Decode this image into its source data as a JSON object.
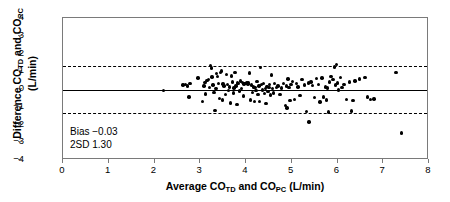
{
  "chart_data": {
    "type": "scatter",
    "title": "",
    "xlabel": "Average CO_TD and CO_PC (L/min)",
    "ylabel": "Difference CO_TD and CO_PC (L/min)",
    "xlim": [
      0,
      8
    ],
    "ylim": [
      -4,
      4
    ],
    "xticks": [
      0,
      1,
      2,
      3,
      4,
      5,
      6,
      7,
      8
    ],
    "yticks": [
      -4,
      -3,
      -2,
      -1,
      0,
      1,
      2,
      3,
      4
    ],
    "grid": false,
    "legend": null,
    "bias": -0.03,
    "two_sd": 1.3,
    "reference_lines": [
      {
        "name": "bias",
        "y": -0.03,
        "style": "solid"
      },
      {
        "name": "upper-limit-of-agreement",
        "y": 1.27,
        "style": "dashed"
      },
      {
        "name": "lower-limit-of-agreement",
        "y": -1.33,
        "style": "dashed"
      }
    ],
    "points": [
      [
        2.2,
        -0.1
      ],
      [
        2.62,
        0.22
      ],
      [
        2.68,
        0.24
      ],
      [
        2.72,
        0.18
      ],
      [
        2.75,
        -0.45
      ],
      [
        2.78,
        0.3
      ],
      [
        2.95,
        0.62
      ],
      [
        3.05,
        -0.72
      ],
      [
        3.08,
        0.18
      ],
      [
        3.1,
        0.35
      ],
      [
        3.12,
        -0.28
      ],
      [
        3.15,
        0.48
      ],
      [
        3.18,
        0.52
      ],
      [
        3.2,
        0.1
      ],
      [
        3.22,
        1.32
      ],
      [
        3.24,
        1.18
      ],
      [
        3.26,
        0.68
      ],
      [
        3.28,
        0.22
      ],
      [
        3.3,
        -0.18
      ],
      [
        3.32,
        -1.22
      ],
      [
        3.34,
        0.02
      ],
      [
        3.36,
        0.88
      ],
      [
        3.38,
        0.72
      ],
      [
        3.4,
        0.3
      ],
      [
        3.42,
        -0.52
      ],
      [
        3.44,
        0.92
      ],
      [
        3.46,
        1.02
      ],
      [
        3.48,
        -0.62
      ],
      [
        3.5,
        0.28
      ],
      [
        3.52,
        0.18
      ],
      [
        3.55,
        -0.3
      ],
      [
        3.58,
        0.82
      ],
      [
        3.6,
        0.26
      ],
      [
        3.62,
        -0.08
      ],
      [
        3.64,
        0.12
      ],
      [
        3.66,
        -0.78
      ],
      [
        3.68,
        0.74
      ],
      [
        3.7,
        0.4
      ],
      [
        3.72,
        -0.22
      ],
      [
        3.74,
        0.06
      ],
      [
        3.76,
        0.92
      ],
      [
        3.78,
        0.18
      ],
      [
        3.8,
        -0.88
      ],
      [
        3.82,
        0.34
      ],
      [
        3.84,
        0.3
      ],
      [
        3.86,
        -0.12
      ],
      [
        3.88,
        0.46
      ],
      [
        3.9,
        0.02
      ],
      [
        3.92,
        0.36
      ],
      [
        3.94,
        -0.4
      ],
      [
        3.96,
        0.28
      ],
      [
        3.98,
        0.32
      ],
      [
        4.0,
        0.3
      ],
      [
        4.02,
        0.34
      ],
      [
        4.04,
        0.28
      ],
      [
        4.06,
        0.36
      ],
      [
        4.08,
        0.9
      ],
      [
        4.1,
        -0.62
      ],
      [
        4.12,
        0.22
      ],
      [
        4.14,
        -0.18
      ],
      [
        4.16,
        0.12
      ],
      [
        4.18,
        -0.7
      ],
      [
        4.2,
        0.08
      ],
      [
        4.22,
        -0.1
      ],
      [
        4.24,
        0.44
      ],
      [
        4.26,
        -0.32
      ],
      [
        4.28,
        0.18
      ],
      [
        4.3,
        -0.72
      ],
      [
        4.32,
        1.22
      ],
      [
        4.34,
        0.26
      ],
      [
        4.36,
        -0.06
      ],
      [
        4.38,
        0.3
      ],
      [
        4.4,
        -0.26
      ],
      [
        4.42,
        0.02
      ],
      [
        4.44,
        -0.82
      ],
      [
        4.46,
        0.14
      ],
      [
        4.48,
        -0.14
      ],
      [
        4.5,
        0.1
      ],
      [
        4.52,
        0.26
      ],
      [
        4.54,
        -0.34
      ],
      [
        4.56,
        0.8
      ],
      [
        4.58,
        0.04
      ],
      [
        4.6,
        -0.22
      ],
      [
        4.62,
        0.3
      ],
      [
        4.66,
        0.08
      ],
      [
        4.7,
        0.16
      ],
      [
        4.74,
        -0.3
      ],
      [
        4.78,
        0.06
      ],
      [
        4.82,
        0.32
      ],
      [
        4.86,
        -0.92
      ],
      [
        4.88,
        0.18
      ],
      [
        4.9,
        -1.08
      ],
      [
        4.92,
        0.56
      ],
      [
        4.94,
        0.08
      ],
      [
        4.96,
        -0.66
      ],
      [
        4.98,
        0.26
      ],
      [
        5.02,
        0.44
      ],
      [
        5.06,
        -0.58
      ],
      [
        5.1,
        0.3
      ],
      [
        5.14,
        0.12
      ],
      [
        5.18,
        -0.36
      ],
      [
        5.22,
        0.52
      ],
      [
        5.28,
        0.22
      ],
      [
        5.32,
        -1.28
      ],
      [
        5.36,
        0.34
      ],
      [
        5.38,
        -1.86
      ],
      [
        5.42,
        0.4
      ],
      [
        5.46,
        0.2
      ],
      [
        5.5,
        -0.48
      ],
      [
        5.54,
        0.58
      ],
      [
        5.58,
        0.26
      ],
      [
        5.62,
        -0.74
      ],
      [
        5.66,
        0.62
      ],
      [
        5.7,
        -0.44
      ],
      [
        5.74,
        0.12
      ],
      [
        5.76,
        -0.62
      ],
      [
        5.78,
        0.06
      ],
      [
        5.8,
        -1.3
      ],
      [
        5.82,
        0.4
      ],
      [
        5.86,
        0.7
      ],
      [
        5.9,
        0.54
      ],
      [
        5.94,
        1.24
      ],
      [
        5.96,
        0.22
      ],
      [
        5.98,
        1.38
      ],
      [
        6.0,
        0.34
      ],
      [
        6.02,
        -0.06
      ],
      [
        6.06,
        0.64
      ],
      [
        6.1,
        0.08
      ],
      [
        6.14,
        0.26
      ],
      [
        6.2,
        -0.58
      ],
      [
        6.26,
        0.4
      ],
      [
        6.3,
        -1.24
      ],
      [
        6.34,
        -0.64
      ],
      [
        6.38,
        0.46
      ],
      [
        6.48,
        0.56
      ],
      [
        6.6,
        0.66
      ],
      [
        6.66,
        -0.46
      ],
      [
        6.72,
        -0.58
      ],
      [
        6.8,
        -0.56
      ],
      [
        7.28,
        0.92
      ],
      [
        7.4,
        -2.48
      ]
    ]
  },
  "annotations": {
    "bias_text": "Bias −0.03",
    "sd_text": "2SD 1.30"
  },
  "axes": {
    "x": {
      "title_parts": [
        "Average CO",
        "TD",
        " and CO",
        "PC",
        " (L/min)"
      ],
      "tick_labels": [
        "0",
        "1",
        "2",
        "3",
        "4",
        "5",
        "6",
        "7",
        "8"
      ]
    },
    "y": {
      "title_line1_parts": [
        "Difference CO",
        "TD",
        " and CO",
        "PC"
      ],
      "title_line2": "(L/min)",
      "tick_labels": [
        "4",
        "3",
        "2",
        "1",
        "0",
        "−1",
        "−2",
        "−3",
        "−4"
      ]
    }
  },
  "colors": {
    "point": "#000000",
    "frame": "#7a7a7a",
    "reference": "#000000",
    "background": "#ffffff"
  }
}
